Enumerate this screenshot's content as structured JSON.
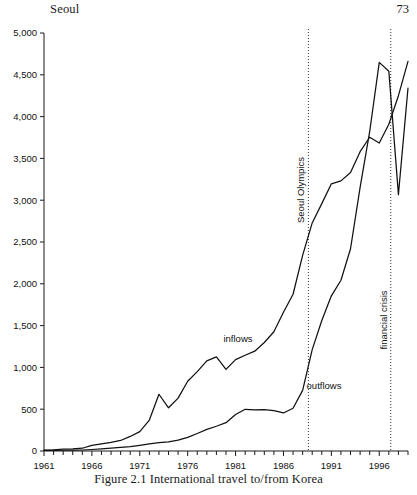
{
  "running_head": {
    "title": "Seoul",
    "page_number": "73"
  },
  "caption": "Figure 2.1  International travel to/from Korea",
  "chart_data": {
    "type": "line",
    "title": "",
    "subtitle": "",
    "xlabel": "",
    "ylabel": "",
    "grid": false,
    "legend_position": "inline-annotation",
    "xlim": [
      1961,
      1999
    ],
    "ylim": [
      0,
      5000
    ],
    "y_ticks": [
      0,
      500,
      1000,
      1500,
      2000,
      2500,
      3000,
      3500,
      4000,
      4500,
      5000
    ],
    "y_tick_labels": [
      "0",
      "500",
      "1,000",
      "1,500",
      "2,000",
      "2,500",
      "3,000",
      "3,500",
      "4,000",
      "4,500",
      "5,000"
    ],
    "x_ticks": [
      1961,
      1966,
      1971,
      1976,
      1981,
      1986,
      1991,
      1996
    ],
    "x_tick_labels": [
      "1961",
      "1966",
      "1971",
      "1976",
      "1981",
      "1986",
      "1991",
      "1996"
    ],
    "x_minor_tick_step": 1,
    "x": [
      1961,
      1962,
      1963,
      1964,
      1965,
      1966,
      1967,
      1968,
      1969,
      1970,
      1971,
      1972,
      1973,
      1974,
      1975,
      1976,
      1977,
      1978,
      1979,
      1980,
      1981,
      1982,
      1983,
      1984,
      1985,
      1986,
      1987,
      1988,
      1989,
      1990,
      1991,
      1992,
      1993,
      1994,
      1995,
      1996,
      1997,
      1998,
      1999
    ],
    "series": [
      {
        "name": "inflows",
        "label": "inflows",
        "values": [
          11,
          15,
          22,
          24,
          33,
          67,
          84,
          102,
          126,
          174,
          232,
          370,
          679,
          517,
          633,
          834,
          949,
          1079,
          1126,
          976,
          1093,
          1145,
          1194,
          1298,
          1426,
          1660,
          1875,
          2340,
          2728,
          2959,
          3196,
          3231,
          3331,
          3580,
          3753,
          3684,
          3908,
          4250,
          4660
        ]
      },
      {
        "name": "outflows",
        "label": "outflows",
        "values": [
          7,
          8,
          9,
          10,
          12,
          18,
          25,
          33,
          42,
          53,
          68,
          85,
          100,
          110,
          129,
          163,
          209,
          259,
          296,
          339,
          437,
          499,
          493,
          494,
          484,
          455,
          511,
          725,
          1213,
          1561,
          1856,
          2043,
          2419,
          3154,
          3819,
          4649,
          4542,
          3067,
          4342
        ]
      }
    ],
    "annotations": [
      {
        "name": "seoul-olympics",
        "label": "Seoul Olympics",
        "x": 1988.6,
        "orientation": "vertical",
        "style": "dotted"
      },
      {
        "name": "financial-crisis",
        "label": "financial crisis",
        "x": 1997.2,
        "orientation": "vertical",
        "style": "dotted"
      }
    ],
    "colors": {
      "line": "#111111",
      "axis": "#1a1a1a",
      "event_line": "#333333",
      "background": "#ffffff"
    }
  }
}
